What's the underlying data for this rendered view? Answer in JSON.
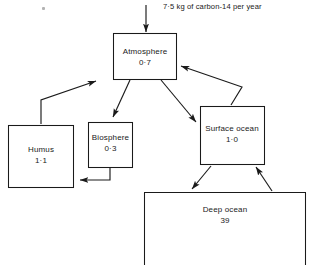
{
  "diagram": {
    "input_flux": {
      "label": "7·5 kg of carbon-14 per year",
      "icon": "down-arrow-icon"
    },
    "stocks": [
      {
        "id": "atmosphere",
        "name": "Atmosphere",
        "value": "0·7"
      },
      {
        "id": "humus",
        "name": "Humus",
        "value": "1·1"
      },
      {
        "id": "biosphere",
        "name": "Biosphere",
        "value": "0·3"
      },
      {
        "id": "surface-ocean",
        "name": "Surface ocean",
        "value": "1·0"
      },
      {
        "id": "deep-ocean",
        "name": "Deep ocean",
        "value": "39"
      }
    ],
    "flows": [
      {
        "id": "input-to-atmosphere",
        "from": "external",
        "to": "atmosphere"
      },
      {
        "id": "atmosphere-to-biosphere",
        "from": "atmosphere",
        "to": "biosphere"
      },
      {
        "id": "atmosphere-to-surface-ocean",
        "from": "atmosphere",
        "to": "surface-ocean"
      },
      {
        "id": "surface-ocean-to-atmosphere",
        "from": "surface-ocean",
        "to": "atmosphere"
      },
      {
        "id": "humus-to-atmosphere",
        "from": "humus",
        "to": "atmosphere"
      },
      {
        "id": "biosphere-to-humus",
        "from": "biosphere",
        "to": "humus"
      },
      {
        "id": "surface-ocean-to-deep-ocean",
        "from": "surface-ocean",
        "to": "deep-ocean"
      },
      {
        "id": "deep-ocean-to-surface-ocean",
        "from": "deep-ocean",
        "to": "surface-ocean"
      }
    ],
    "colors": {
      "stroke": "#1a1a1a",
      "text": "#1a1a1a",
      "background": "#ffffff"
    }
  }
}
